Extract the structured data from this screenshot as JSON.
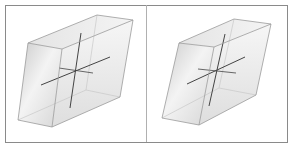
{
  "figure": {
    "width": 289,
    "height": 144,
    "frame": {
      "x": 5,
      "y": 5,
      "w": 282,
      "h": 137,
      "divider_x": 146,
      "stroke": "#8a8a8a"
    },
    "panels": [
      {
        "name": "left-panel",
        "label": "",
        "box": {
          "front_face": [
            [
              28,
              43
            ],
            [
              18,
              120
            ],
            [
              52,
              127
            ],
            [
              62,
              49
            ]
          ],
          "back_top": [
            [
              97,
              15
            ],
            [
              133,
              20
            ]
          ],
          "right_bottom": [
            120,
            97
          ],
          "edge_color": "#9a9a9a",
          "fill_light": "#f7f7f7",
          "fill_dark": "#c9c9c9"
        },
        "axes": {
          "center": [
            76,
            70
          ],
          "vertical": [
            [
              81,
              33
            ],
            [
              70,
              108
            ]
          ],
          "horizontal": [
            [
              41,
              85
            ],
            [
              110,
              57
            ]
          ],
          "depth": [
            [
              59,
              68
            ],
            [
              93,
              73
            ]
          ],
          "color": "#444444"
        }
      },
      {
        "name": "right-panel",
        "label": "",
        "box": {
          "front_face": [
            [
              179,
              43
            ],
            [
              162,
              118
            ],
            [
              199,
              125
            ],
            [
              214,
              47
            ]
          ],
          "back_top": [
            [
              234,
              19
            ],
            [
              271,
              24
            ]
          ],
          "right_bottom": [
            256,
            95
          ],
          "edge_color": "#9a9a9a",
          "fill_light": "#f7f7f7",
          "fill_dark": "#c9c9c9"
        },
        "axes": {
          "center": [
            217,
            71
          ],
          "vertical": [
            [
              225,
              34
            ],
            [
              209,
              106
            ]
          ],
          "horizontal": [
            [
              187,
              84
            ],
            [
              245,
              57
            ]
          ],
          "depth": [
            [
              198,
              69
            ],
            [
              236,
              73
            ]
          ],
          "color": "#444444"
        }
      }
    ]
  }
}
